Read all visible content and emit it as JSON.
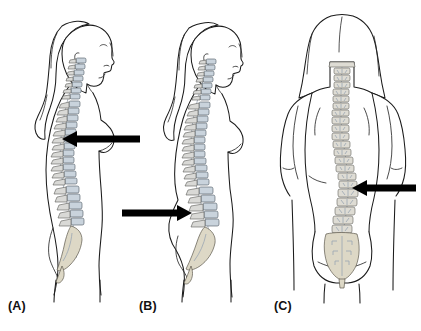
{
  "figure": {
    "background_color": "#ffffff",
    "line_color": "#1b1b1b",
    "arrow_color": "#000000",
    "vertebra_body_color": "#c9d3dc",
    "vertebra_process_color": "#d9d9d6",
    "sacrum_color": "#ddd8c6",
    "panels": [
      {
        "label": "(A)",
        "view": "lateral-left-side-view",
        "subject": "female-figure-standing-profile",
        "highlight": "thoracic-spine",
        "arrow": {
          "direction": "left",
          "points_to": "thoracic-curve",
          "tail_x": 140,
          "head_x": 62,
          "y": 139
        }
      },
      {
        "label": "(B)",
        "view": "lateral-left-side-view",
        "subject": "female-figure-standing-profile",
        "highlight": "lumbar-spine",
        "arrow": {
          "direction": "right",
          "points_to": "lumbar-curve",
          "tail_x": 122,
          "head_x": 176,
          "y": 213
        }
      },
      {
        "label": "(C)",
        "view": "posterior-back-view",
        "subject": "female-figure-standing-back",
        "highlight": "lateral-spinal-curvature",
        "arrow": {
          "direction": "left",
          "points_to": "lateral-curve",
          "tail_x": 416,
          "head_x": 352,
          "y": 188
        }
      }
    ]
  }
}
